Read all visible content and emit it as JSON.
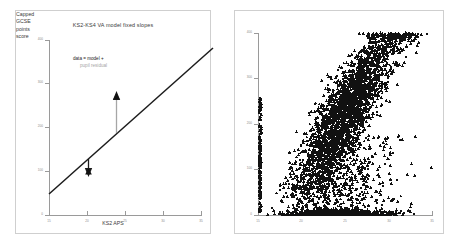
{
  "figure": {
    "background": "#ffffff",
    "panel_border_color": "#cfcfcf",
    "axis_color": "#9a9a9a",
    "marker_color": "#111111",
    "line_color": "#1c1c1c",
    "residual_gray": "#a6a6a6"
  },
  "left_panel": {
    "title": "KS2-KS4 VA model fixed slopes",
    "xlabel": "KS2 APS",
    "ylabel": "Capped GCSE points score",
    "ylabel_lines": [
      "Capped",
      "GCSE",
      "points",
      "score"
    ],
    "annotation_line1": "data = model +",
    "annotation_line2": "pupil residual"
  },
  "right_panel": {
    "title": "",
    "xlabel": "",
    "ylabel": ""
  },
  "chart_data": [
    {
      "type": "line",
      "title": "KS2-KS4 VA model fixed slopes",
      "xlabel": "KS2 APS",
      "ylabel": "Capped GCSE points score",
      "xlim": [
        15,
        35
      ],
      "ylim": [
        0,
        400
      ],
      "xticks": [
        15,
        20,
        25,
        30,
        35
      ],
      "yticks": [
        0,
        100,
        200,
        300,
        400
      ],
      "grid": false,
      "legend": "none",
      "series": [
        {
          "name": "fixed slope regression line",
          "x": [
            15,
            35
          ],
          "values": [
            48,
            352
          ]
        }
      ],
      "annotations": [
        {
          "text": "data = model +",
          "color": "#1c1c1c",
          "x": 19.8,
          "y": 330
        },
        {
          "text": "pupil residual",
          "color": "#a6a6a6",
          "x": 21.2,
          "y": 312
        },
        {
          "text": "negative residual arrow",
          "type": "arrow",
          "x": 22.6,
          "y_from": 175,
          "y_to": 100,
          "marker": "triangle-down"
        },
        {
          "text": "positive residual arrow",
          "type": "arrow",
          "x": 26.2,
          "y_from": 212,
          "y_to": 285,
          "marker": "triangle-up"
        }
      ]
    },
    {
      "type": "scatter",
      "title": "",
      "xlabel": "",
      "ylabel": "",
      "xlim": [
        15,
        35
      ],
      "ylim": [
        0,
        400
      ],
      "xticks": [
        15,
        20,
        25,
        30,
        35
      ],
      "yticks": [
        0,
        100,
        200,
        300,
        400
      ],
      "grid": false,
      "legend": "none",
      "marker": "triangle",
      "marker_color": "#111111",
      "point_count": 3400,
      "description": "Dense positively-correlated cloud of pupil points, KS2 APS versus capped GCSE points score, with a floor of zero-score pupils along the x-axis."
    }
  ]
}
